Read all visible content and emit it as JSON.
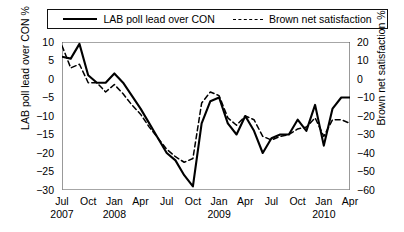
{
  "chart_data": {
    "type": "line",
    "title": "",
    "xlabel": "",
    "ylabel": "LAB poll lead over CON %",
    "y2label": "Brown net satisfaction %",
    "grid": false,
    "legend_position": "top",
    "ylim": [
      -30,
      10
    ],
    "y2lim": [
      -60,
      20
    ],
    "yticks": [
      "10",
      "5",
      "0",
      "-5",
      "-10",
      "-15",
      "-20",
      "-25",
      "-30"
    ],
    "ytick_values": [
      10,
      5,
      0,
      -5,
      -10,
      -15,
      -20,
      -25,
      -30
    ],
    "y2ticks": [
      "20",
      "10",
      "0",
      "-10",
      "-20",
      "-30",
      "-40",
      "-50",
      "-60"
    ],
    "y2tick_values": [
      20,
      10,
      0,
      -10,
      -20,
      -30,
      -40,
      -50,
      -60
    ],
    "xticks": [
      {
        "month": "Jul",
        "year": "2007"
      },
      {
        "month": "Oct",
        "year": ""
      },
      {
        "month": "Jan",
        "year": "2008"
      },
      {
        "month": "Apr",
        "year": ""
      },
      {
        "month": "Jul",
        "year": ""
      },
      {
        "month": "Oct",
        "year": ""
      },
      {
        "month": "Jan",
        "year": "2009"
      },
      {
        "month": "Apr",
        "year": ""
      },
      {
        "month": "Jul",
        "year": ""
      },
      {
        "month": "Oct",
        "year": ""
      },
      {
        "month": "Jan",
        "year": "2010"
      },
      {
        "month": "Apr",
        "year": ""
      }
    ],
    "xlim_months": [
      0,
      33
    ],
    "series": [
      {
        "name": "LAB poll lead over CON",
        "axis": "left",
        "style": "solid",
        "color": "#000000",
        "x": [
          0,
          1,
          2,
          3,
          4,
          5,
          6,
          7,
          8,
          9,
          10,
          11,
          12,
          13,
          14,
          15,
          16,
          17,
          18,
          19,
          20,
          21,
          22,
          23,
          24,
          25,
          26,
          27,
          28,
          29,
          30,
          31,
          32,
          33
        ],
        "values": [
          6,
          5.5,
          9.5,
          1,
          -1,
          -1,
          1.5,
          -1,
          -4.5,
          -8,
          -12,
          -16,
          -20,
          -22,
          -26,
          -29,
          -12,
          -6,
          -5,
          -12,
          -15,
          -10,
          -14,
          -20,
          -16,
          -15,
          -15,
          -11,
          -14,
          -7,
          -18,
          -8,
          -5,
          -5
        ]
      },
      {
        "name": "Brown net satisfaction",
        "axis": "right",
        "style": "dashed",
        "color": "#000000",
        "x": [
          0,
          1,
          2,
          3,
          4,
          5,
          6,
          7,
          8,
          9,
          10,
          11,
          12,
          13,
          14,
          15,
          16,
          17,
          18,
          19,
          20,
          21,
          22,
          23,
          24,
          25,
          26,
          27,
          28,
          29,
          30,
          31,
          32,
          33
        ],
        "values": [
          18,
          6,
          8,
          -2,
          -2,
          -7,
          -3,
          -8,
          -14,
          -19,
          -26,
          -32,
          -38,
          -42,
          -45,
          -43,
          -13,
          -7,
          -9,
          -21,
          -25,
          -20,
          -22,
          -31,
          -33,
          -31,
          -30,
          -27,
          -26,
          -21,
          -31,
          -22,
          -22,
          -24
        ]
      }
    ]
  },
  "legend": {
    "items": [
      {
        "label": "LAB poll lead over CON",
        "style": "solid"
      },
      {
        "label": "Brown net satisfaction",
        "style": "dashed"
      }
    ]
  }
}
